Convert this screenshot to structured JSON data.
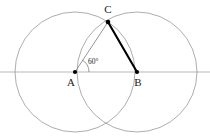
{
  "figure": {
    "type": "geometry-diagram",
    "width": 210,
    "height": 139,
    "background_color": "#ffffff",
    "labels": {
      "point_a": "A",
      "point_b": "B",
      "point_c": "C",
      "angle": "60°"
    },
    "colors": {
      "circle_stroke": "#8a8a8a",
      "axis_stroke": "#9a9a9a",
      "thin_segment": "#7a7a7a",
      "thick_segment": "#000000",
      "label_text": "#1a1a1a"
    },
    "points": [
      {
        "name": "A",
        "label": "A",
        "x": 75,
        "y": 72,
        "label_x": 71,
        "label_y": 86
      },
      {
        "name": "B",
        "label": "B",
        "x": 137,
        "y": 72,
        "label_x": 135,
        "label_y": 86
      },
      {
        "name": "C",
        "label": "C",
        "x": 108,
        "y": 22,
        "label_x": 105,
        "label_y": 13
      }
    ],
    "circles": [
      {
        "name": "circle-centered-at-a",
        "cx": 75,
        "cy": 72,
        "r": 60
      },
      {
        "name": "circle-centered-at-b",
        "cx": 137,
        "cy": 72,
        "r": 60
      }
    ],
    "segments": [
      {
        "name": "segment-a-to-c",
        "x1": 75,
        "y1": 72,
        "x2": 108,
        "y2": 22,
        "weight": "thin"
      },
      {
        "name": "segment-b-to-c",
        "x1": 137,
        "y1": 72,
        "x2": 108,
        "y2": 22,
        "weight": "thick"
      }
    ],
    "axis": {
      "name": "horizontal-axis",
      "x1": 0,
      "y1": 72,
      "x2": 210,
      "y2": 72
    },
    "angle_mark": {
      "vertex": "A",
      "value": "60°",
      "arc_path": "M 89 72 A 14 14 0 0 0 82.4 60.1",
      "label_x": 85,
      "label_y": 63
    }
  }
}
